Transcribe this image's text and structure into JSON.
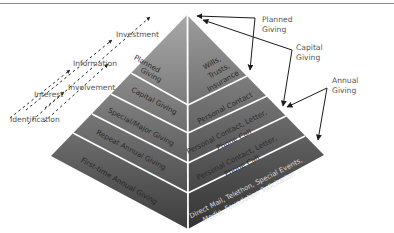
{
  "stages": [
    {
      "label": "Identification",
      "x": 10,
      "y": 122
    },
    {
      "label": "Interest",
      "x": 34,
      "y": 97
    },
    {
      "label": "Involvement",
      "x": 68,
      "y": 90
    },
    {
      "label": "Information",
      "x": 73,
      "y": 66
    },
    {
      "label": "Investment",
      "x": 116,
      "y": 37
    }
  ],
  "left_face": {
    "tiers": [
      {
        "label": "Planned",
        "label2": "Giving"
      },
      {
        "label": "Capital Giving"
      },
      {
        "label": "Special/Major Giving"
      },
      {
        "label": "Repeat Annual Giving"
      },
      {
        "label": "First-time Annual Giving"
      }
    ]
  },
  "right_face": {
    "tiers": [
      {
        "label": "Wills,",
        "label2": "Trusts,",
        "label3": "Insurance"
      },
      {
        "label": "Personal Contact"
      },
      {
        "label": "Personal Contact, Letter,",
        "label2": "Phone Call"
      },
      {
        "label": "Personal Contact, Letter,",
        "label2": "Phone Call"
      },
      {
        "label": "Direct Mail, Telethon, Special Events,",
        "label2": "Media, Foundation Solicitation"
      }
    ]
  },
  "callouts": [
    {
      "label": "Planned",
      "label2": "Giving"
    },
    {
      "label": "Capital",
      "label2": "Giving"
    },
    {
      "label": "Annual",
      "label2": "Giving"
    }
  ],
  "colors": {
    "tier_top": "#9a9a9a",
    "tier_bottom": "#3a3a3a",
    "divider": "#ffffff",
    "arrow": "#1a1a1a",
    "label_text": "#555555",
    "tier_text": "#2a2a2a",
    "tier_text_light": "#d8d8d8"
  }
}
